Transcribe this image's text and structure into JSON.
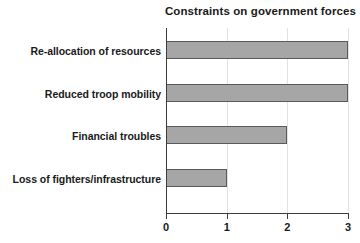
{
  "chart_data": {
    "type": "bar",
    "orientation": "horizontal",
    "title": "Constraints on government forces",
    "xlabel": "",
    "ylabel": "",
    "categories": [
      "Re-allocation of resources",
      "Reduced troop mobility",
      "Financial troubles",
      "Loss of fighters/infrastructure"
    ],
    "values": [
      3,
      3,
      2,
      1
    ],
    "xlim": [
      0,
      3
    ],
    "xticks": [
      0,
      1,
      2,
      3
    ],
    "xtick_labels": [
      "0",
      "1",
      "2",
      "3"
    ],
    "grid": "vertical-light",
    "legend": "none",
    "bar_fill_color": "#a6a6a6",
    "bar_edge_color": "#5a5a5a",
    "axis_color": "#3c3c3c",
    "text_color": "#1a1a1a",
    "background_color": "#ffffff"
  }
}
